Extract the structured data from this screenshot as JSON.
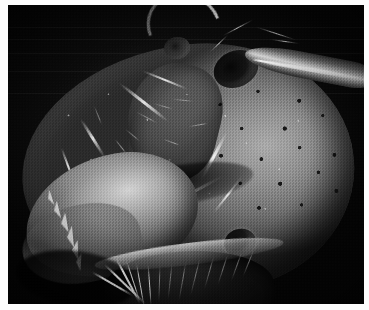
{
  "figure": {
    "kind": "scanning-electron-micrograph",
    "caption": "",
    "border_color": "#ffffff",
    "background_color": "#050505",
    "plate": {
      "left": 8,
      "top": 5,
      "width": 356,
      "height": 299
    },
    "canvas": {
      "width": 369,
      "height": 310
    }
  },
  "tones": {
    "paper_white": "#ffffff",
    "deep_black": "#050505",
    "shadow": "#1a1a1a",
    "midtone": "#6f6f6f",
    "highlight": "#d2d2d2",
    "specular": "#f2f2f2"
  },
  "anatomy": {
    "head_capsule": {
      "label": "head capsule",
      "tone": "midtone"
    },
    "mandible": {
      "label": "serrated mandible",
      "teeth_count": 6,
      "tone": "highlight"
    },
    "antennal_socket": {
      "label": "antennal socket",
      "tone": "deep_black"
    },
    "scape": {
      "label": "antennal scape",
      "tone": "highlight"
    },
    "ocellus": {
      "label": "ocellus",
      "tone": "deep_black"
    },
    "socket_small": {
      "label": "secondary socket",
      "tone": "shadow"
    },
    "carina": {
      "label": "frontal carina",
      "tone": "midtone"
    },
    "clypeal_groove": {
      "label": "clypeal groove",
      "tone": "shadow"
    },
    "punctures": {
      "label": "cuticular punctures",
      "count": 16,
      "tone": "deep_black"
    },
    "setae": {
      "label": "setae",
      "count": 22,
      "tone": "specular"
    },
    "mouthparts": {
      "label": "mouthparts",
      "tone": "deep_black"
    },
    "appendage_top": {
      "label": "curved appendage",
      "tone": "specular"
    }
  },
  "teeth": [
    {
      "x": 46,
      "y": 196,
      "size": 9,
      "rot": -14
    },
    {
      "x": 53,
      "y": 208,
      "size": 10,
      "rot": -10
    },
    {
      "x": 59,
      "y": 221,
      "size": 11,
      "rot": -6
    },
    {
      "x": 64,
      "y": 235,
      "size": 10,
      "rot": -2
    },
    {
      "x": 68,
      "y": 248,
      "size": 9,
      "rot": 3
    },
    {
      "x": 40,
      "y": 185,
      "size": 8,
      "rot": -18
    }
  ],
  "setae_list": [
    {
      "x": 108,
      "y": 252,
      "len": 52,
      "rot": 62,
      "w": 1.6,
      "dim": false
    },
    {
      "x": 118,
      "y": 254,
      "len": 46,
      "rot": 72,
      "w": 1.4,
      "dim": false
    },
    {
      "x": 128,
      "y": 256,
      "len": 50,
      "rot": 80,
      "w": 1.3,
      "dim": false
    },
    {
      "x": 140,
      "y": 258,
      "len": 44,
      "rot": 86,
      "w": 1.2,
      "dim": false
    },
    {
      "x": 152,
      "y": 258,
      "len": 40,
      "rot": 92,
      "w": 1.2,
      "dim": true
    },
    {
      "x": 164,
      "y": 257,
      "len": 38,
      "rot": 96,
      "w": 1.1,
      "dim": true
    },
    {
      "x": 178,
      "y": 255,
      "len": 42,
      "rot": 100,
      "w": 1.2,
      "dim": true
    },
    {
      "x": 192,
      "y": 252,
      "len": 40,
      "rot": 104,
      "w": 1.1,
      "dim": true
    },
    {
      "x": 206,
      "y": 250,
      "len": 36,
      "rot": 106,
      "w": 1.0,
      "dim": true
    },
    {
      "x": 220,
      "y": 248,
      "len": 34,
      "rot": 108,
      "w": 1.0,
      "dim": true
    },
    {
      "x": 234,
      "y": 246,
      "len": 32,
      "rot": 110,
      "w": 1.0,
      "dim": true
    },
    {
      "x": 246,
      "y": 244,
      "len": 30,
      "rot": 112,
      "w": 0.9,
      "dim": true
    },
    {
      "x": 96,
      "y": 258,
      "len": 58,
      "rot": 44,
      "w": 1.8,
      "dim": false
    },
    {
      "x": 84,
      "y": 266,
      "len": 48,
      "rot": 30,
      "w": 1.6,
      "dim": false
    },
    {
      "x": 150,
      "y": 118,
      "len": 26,
      "rot": 208,
      "w": 1.0,
      "dim": true
    },
    {
      "x": 166,
      "y": 104,
      "len": 22,
      "rot": 196,
      "w": 0.9,
      "dim": true
    },
    {
      "x": 132,
      "y": 136,
      "len": 20,
      "rot": 220,
      "w": 0.9,
      "dim": true
    },
    {
      "x": 186,
      "y": 96,
      "len": 24,
      "rot": 186,
      "w": 0.9,
      "dim": true
    },
    {
      "x": 118,
      "y": 148,
      "len": 18,
      "rot": 232,
      "w": 0.8,
      "dim": true
    },
    {
      "x": 200,
      "y": 118,
      "len": 20,
      "rot": 170,
      "w": 0.8,
      "dim": true
    },
    {
      "x": 94,
      "y": 120,
      "len": 22,
      "rot": 248,
      "w": 0.9,
      "dim": true
    },
    {
      "x": 172,
      "y": 140,
      "len": 18,
      "rot": 200,
      "w": 0.8,
      "dim": true
    }
  ],
  "ridges": [
    {
      "x": 104,
      "y": 96,
      "w": 64,
      "h": 3,
      "rot": 38
    },
    {
      "x": 132,
      "y": 74,
      "w": 50,
      "h": 2.4,
      "rot": 22
    },
    {
      "x": 62,
      "y": 132,
      "w": 46,
      "h": 2.6,
      "rot": 58
    },
    {
      "x": 178,
      "y": 150,
      "w": 56,
      "h": 2.8,
      "rot": 118
    },
    {
      "x": 150,
      "y": 186,
      "w": 70,
      "h": 2.6,
      "rot": 152
    },
    {
      "x": 40,
      "y": 160,
      "w": 40,
      "h": 2.2,
      "rot": 70
    },
    {
      "x": 196,
      "y": 188,
      "w": 48,
      "h": 2.4,
      "rot": 128
    },
    {
      "x": 86,
      "y": 180,
      "w": 38,
      "h": 2.0,
      "rot": 26
    }
  ],
  "filaments": [
    {
      "x": 246,
      "y": 28,
      "len": 44,
      "rot": 18,
      "w": 1.4
    },
    {
      "x": 212,
      "y": 22,
      "len": 36,
      "rot": 152,
      "w": 1.2
    },
    {
      "x": 262,
      "y": 36,
      "len": 30,
      "rot": 8,
      "w": 1.1
    },
    {
      "x": 198,
      "y": 38,
      "len": 26,
      "rot": 136,
      "w": 1.0
    }
  ],
  "scanlines": [
    22,
    34,
    48,
    66,
    88
  ]
}
